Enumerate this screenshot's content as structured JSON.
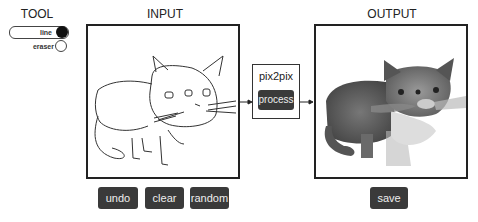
{
  "tool": {
    "title": "TOOL",
    "options": [
      {
        "label": "line",
        "selected": true
      },
      {
        "label": "eraser",
        "selected": false
      }
    ]
  },
  "input": {
    "title": "INPUT",
    "buttons": {
      "undo": "undo",
      "clear": "clear",
      "random": "random"
    }
  },
  "model": {
    "name": "pix2pix",
    "process_label": "process"
  },
  "output": {
    "title": "OUTPUT",
    "save_label": "save"
  },
  "colors": {
    "button_bg": "#3a3a3a",
    "button_text": "#eeeeee",
    "border": "#222222"
  }
}
